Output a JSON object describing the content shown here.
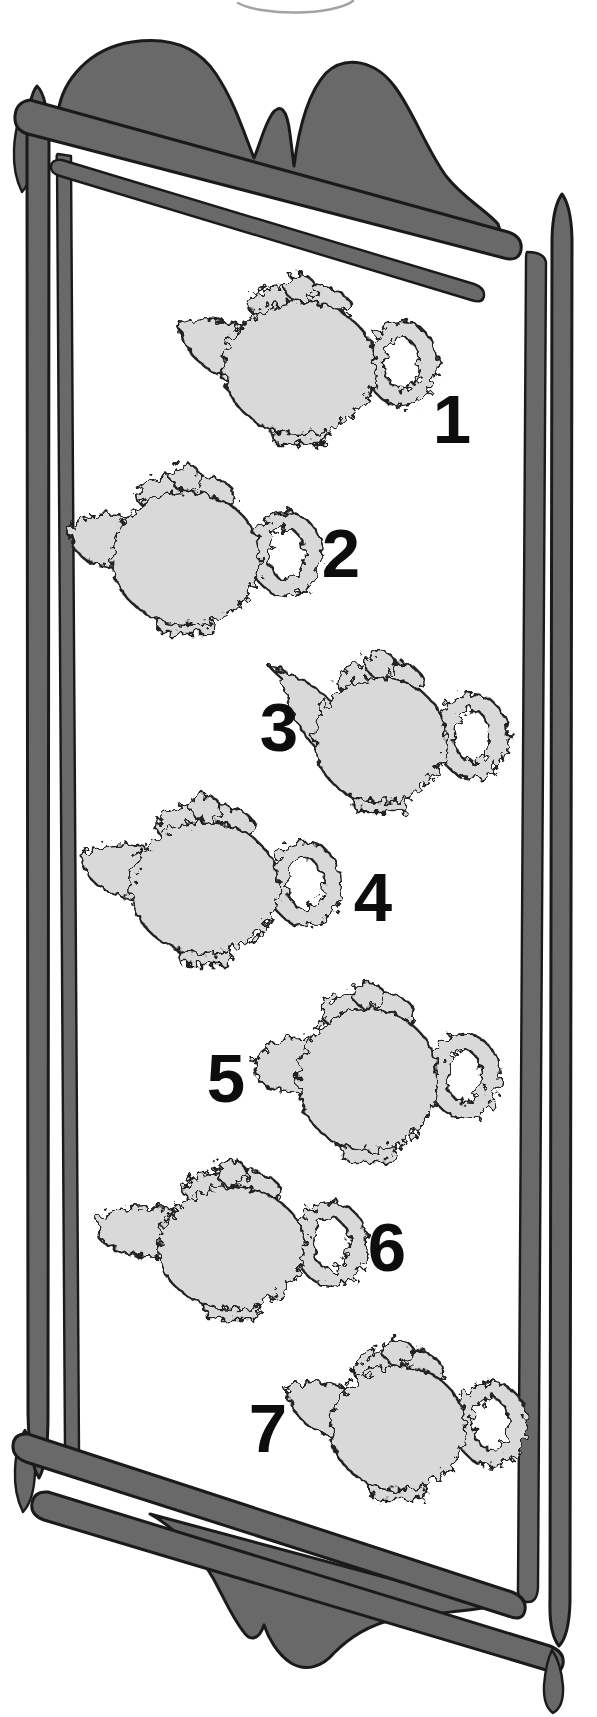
{
  "page": {
    "kind": "puzzle-book illustration: tray of fuzzy teapots numbered 1-7",
    "background": "#ffffff",
    "top_arc": {
      "note": "bottom sliver of a circle cut off by page top edge",
      "stroke": "#a3a3a3"
    },
    "frame": {
      "color": "#696969",
      "outline": "#1a1a1a",
      "style": "hand-drawn tilted wooden tray frame: two-hump crest, double rails top/bottom/sides, pointed leaf corner finials, scalloped apron, teardrop drop finial"
    },
    "teapot_style": {
      "fill": "#d9d9d9",
      "outline": "#232323",
      "edge": "fuzzy jagged scribbled silhouette, spout left, ring handle right, lid knob on top"
    },
    "label_style": {
      "color": "#0d0d0d"
    }
  },
  "teapots": [
    {
      "label": "1",
      "x": 300,
      "y": 368,
      "rx": 76,
      "ry": 66,
      "spout_deg": 36,
      "spout_len": 58,
      "seed": 7,
      "label_x": 452,
      "label_y": 419
    },
    {
      "label": "2",
      "x": 186,
      "y": 558,
      "rx": 74,
      "ry": 66,
      "spout_deg": 26,
      "spout_len": 50,
      "seed": 13,
      "label_x": 341,
      "label_y": 553
    },
    {
      "label": "3",
      "x": 380,
      "y": 740,
      "rx": 66,
      "ry": 62,
      "spout_deg": 56,
      "spout_len": 78,
      "seed": 23,
      "label_x": 279,
      "label_y": 727
    },
    {
      "label": "4",
      "x": 205,
      "y": 888,
      "rx": 74,
      "ry": 66,
      "spout_deg": 26,
      "spout_len": 56,
      "seed": 31,
      "label_x": 373,
      "label_y": 897
    },
    {
      "label": "5",
      "x": 368,
      "y": 1080,
      "rx": 70,
      "ry": 71,
      "spout_deg": 15,
      "spout_len": 46,
      "seed": 41,
      "label_x": 226,
      "label_y": 1078
    },
    {
      "label": "6",
      "x": 232,
      "y": 1248,
      "rx": 73,
      "ry": 61,
      "spout_deg": 18,
      "spout_len": 66,
      "seed": 53,
      "label_x": 387,
      "label_y": 1247
    },
    {
      "label": "7",
      "x": 398,
      "y": 1428,
      "rx": 67,
      "ry": 62,
      "spout_deg": 34,
      "spout_len": 56,
      "seed": 61,
      "label_x": 268,
      "label_y": 1428
    }
  ]
}
